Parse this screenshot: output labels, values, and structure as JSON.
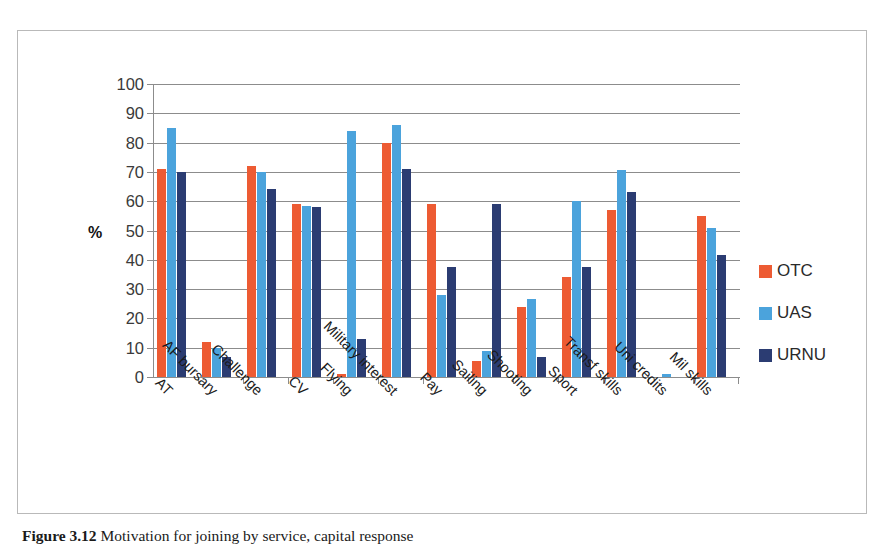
{
  "chart_data": {
    "type": "bar",
    "title": "",
    "xlabel": "",
    "ylabel": "%",
    "ylim": [
      0,
      100
    ],
    "ytick_step": 10,
    "yticks": [
      100,
      90,
      80,
      70,
      60,
      50,
      40,
      30,
      20,
      10,
      0
    ],
    "grid": true,
    "legend_position": "right",
    "categories": [
      "AT",
      "AF bursary",
      "Challenge",
      "CV",
      "Flying",
      "Military interest",
      "Pay",
      "Sailing",
      "Shooting",
      "Sport",
      "Transf skills",
      "Uni credits",
      "Mil skills"
    ],
    "series": [
      {
        "name": "OTC",
        "color": "#ED5B33",
        "values": [
          71,
          12,
          72,
          59,
          1,
          80,
          59,
          5.5,
          24,
          34,
          57,
          0,
          55
        ]
      },
      {
        "name": "UAS",
        "color": "#4BA3DC",
        "values": [
          85,
          10,
          70,
          58.5,
          84,
          86,
          28,
          9,
          26.5,
          60,
          70.5,
          1,
          51
        ]
      },
      {
        "name": "URNU",
        "color": "#2B3C72",
        "values": [
          70,
          7,
          64,
          58,
          13,
          71,
          37.5,
          59,
          7,
          37.5,
          63,
          0,
          41.5
        ]
      }
    ]
  },
  "axis": {
    "y_title": "%"
  },
  "legend": {
    "items": [
      {
        "label": "OTC",
        "color": "#ED5B33"
      },
      {
        "label": "UAS",
        "color": "#4BA3DC"
      },
      {
        "label": "URNU",
        "color": "#2B3C72"
      }
    ]
  },
  "caption": {
    "number": "Figure 3.12",
    "text": "Motivation for joining by service, capital response"
  }
}
